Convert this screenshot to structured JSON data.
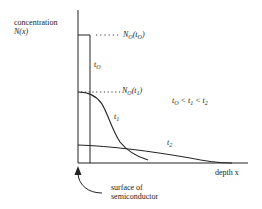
{
  "diagram": {
    "y_axis_label_line1": "concentration",
    "y_axis_label_line2": "N(x)",
    "x_axis_label": "depth x",
    "level_t0": {
      "N": "N",
      "sub": "O",
      "paren_open": "(t",
      "paren_sub": "O",
      "paren_close": ")"
    },
    "level_t1": {
      "N": "N",
      "sub": "O",
      "paren_open": "(t",
      "paren_sub": "1",
      "paren_close": ")"
    },
    "curve_labels": {
      "t0": {
        "t": "t",
        "sub": "O"
      },
      "t1": {
        "t": "t",
        "sub": "1"
      },
      "t2": {
        "t": "t",
        "sub": "2"
      }
    },
    "ordering": {
      "a": "t",
      "a_sub": "O",
      "lt1": " < t",
      "b_sub": "1",
      "lt2": " < t",
      "c_sub": "2"
    },
    "surface_label_line1": "surface of",
    "surface_label_line2": "semiconductor"
  }
}
